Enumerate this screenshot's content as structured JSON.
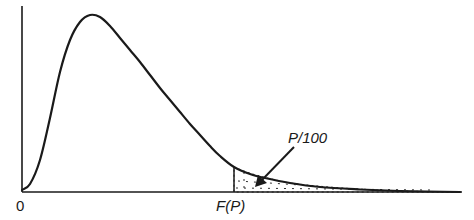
{
  "chart_data": {
    "type": "line",
    "title": "",
    "subtitle": "",
    "xlabel": "",
    "ylabel": "",
    "x_tick_labels": [
      "0",
      "F(P)"
    ],
    "annotations": [
      {
        "text": "P/100",
        "points_to": "shaded tail area right of F(P)"
      }
    ],
    "series": [
      {
        "name": "density",
        "points_px": [
          [
            22,
            190
          ],
          [
            30,
            184
          ],
          [
            40,
            160
          ],
          [
            50,
            118
          ],
          [
            60,
            72
          ],
          [
            70,
            40
          ],
          [
            80,
            22
          ],
          [
            90,
            15
          ],
          [
            100,
            17
          ],
          [
            110,
            26
          ],
          [
            120,
            38
          ],
          [
            130,
            50
          ],
          [
            140,
            62
          ],
          [
            150,
            75
          ],
          [
            160,
            88
          ],
          [
            170,
            100
          ],
          [
            180,
            112
          ],
          [
            190,
            124
          ],
          [
            200,
            135
          ],
          [
            210,
            146
          ],
          [
            220,
            156
          ],
          [
            234,
            167
          ],
          [
            250,
            174
          ],
          [
            265,
            178
          ],
          [
            290,
            183
          ],
          [
            320,
            187
          ],
          [
            360,
            189.5
          ],
          [
            400,
            191
          ],
          [
            460,
            192
          ]
        ]
      }
    ],
    "shaded_region": {
      "from": "F(P)",
      "to": "infinity",
      "style": "dotted"
    },
    "grid": false,
    "legend": null
  },
  "labels": {
    "origin": "0",
    "critical_value": "F(P)",
    "tail_area": "P/100"
  },
  "colors": {
    "ink": "#1a1a1a",
    "background": "#ffffff"
  }
}
